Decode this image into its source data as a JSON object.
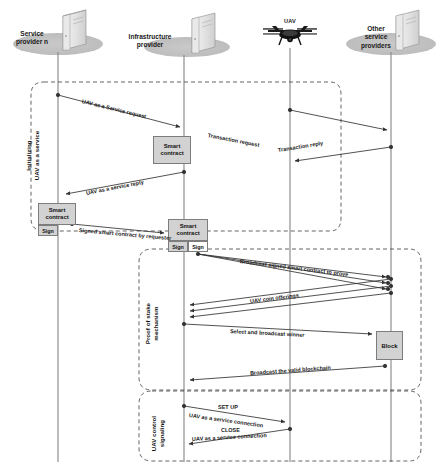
{
  "diagram": {
    "type": "sequence-diagram",
    "accent": "#d2d2d2",
    "line_color": "#808080",
    "dash_color": "#555555"
  },
  "actors": [
    {
      "id": "service-provider-n",
      "label": "Service\nprovider n",
      "icon": "server-icon",
      "x": 58
    },
    {
      "id": "infrastructure-provider",
      "label": "Infrastructure\nprovider",
      "icon": "server-icon",
      "x": 184
    },
    {
      "id": "uav",
      "label": "UAV",
      "icon": "drone-icon",
      "x": 290
    },
    {
      "id": "other-service-providers",
      "label": "Other\nservice\nproviders",
      "icon": "server-icon",
      "x": 391
    }
  ],
  "phases": [
    {
      "id": "initializing",
      "label": "Initializing\nUAV as a service"
    },
    {
      "id": "proof-of-stake",
      "label": "Proof of stake\nmechanism"
    },
    {
      "id": "uav-control-signaling",
      "label": "UAV control\nsignaling"
    }
  ],
  "messages": [
    {
      "id": "m1",
      "label": "UAV as a Service request",
      "from": "service-provider-n",
      "to": "infrastructure-provider"
    },
    {
      "id": "m2",
      "label": "Transaction request",
      "from": "uav",
      "to": "other-service-providers"
    },
    {
      "id": "m3",
      "label": "Transaction reply",
      "from": "other-service-providers",
      "to": "uav"
    },
    {
      "id": "m4",
      "label": "UAV as a service reply",
      "from": "infrastructure-provider",
      "to": "service-provider-n"
    },
    {
      "id": "m5",
      "label": "Signed smart contract by requester",
      "from": "service-provider-n",
      "to": "infrastructure-provider"
    },
    {
      "id": "m6",
      "label": "Broadcast signed smart contract to prove",
      "from": "infrastructure-provider",
      "to": "other-service-providers"
    },
    {
      "id": "m7",
      "label": "UAV coin offerings",
      "from": "other-service-providers",
      "to": "infrastructure-provider"
    },
    {
      "id": "m8",
      "label": "Select and broadcast winner",
      "from": "infrastructure-provider",
      "to": "other-service-providers"
    },
    {
      "id": "m9",
      "label": "Broadcast the valid blockchain",
      "from": "other-service-providers",
      "to": "infrastructure-provider"
    },
    {
      "id": "m10",
      "label": "SET UP",
      "from": "infrastructure-provider",
      "to": "uav"
    },
    {
      "id": "m11",
      "label": "UAV as a service connection",
      "from": "infrastructure-provider",
      "to": "uav"
    },
    {
      "id": "m12",
      "label": "CLOSE",
      "from": "uav",
      "to": "infrastructure-provider"
    },
    {
      "id": "m13",
      "label": "UAV as a service connection",
      "from": "uav",
      "to": "infrastructure-provider"
    }
  ],
  "boxes": [
    {
      "id": "smart-contract-1",
      "label": "Smart\ncontract",
      "signs": []
    },
    {
      "id": "smart-contract-2",
      "label": "Smart\ncontract",
      "signs": [
        "Sign"
      ]
    },
    {
      "id": "smart-contract-3",
      "label": "Smart\ncontract",
      "signs": [
        "Sign",
        "Sign"
      ]
    },
    {
      "id": "block",
      "label": "Block"
    }
  ],
  "labels": {
    "smart_contract": "Smart contract",
    "sign": "Sign",
    "block": "Block"
  }
}
